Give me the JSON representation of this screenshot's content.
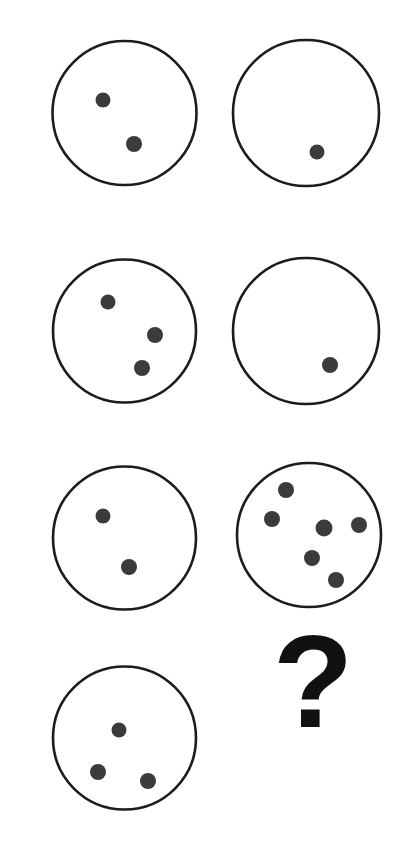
{
  "page": {
    "background_color": "#ffffff",
    "width": 418,
    "height": 841
  },
  "style": {
    "circle_stroke_color": "#1c1c1c",
    "circle_fill_color": "#ffffff",
    "circle_stroke_width": 2.6,
    "dot_color": "#3b3b3b",
    "question_mark_color": "#111111"
  },
  "puzzle": {
    "type": "visual-matrix-reasoning",
    "columns": 2,
    "rows": 4,
    "missing_cell_label": "?",
    "missing_cell_row": 4,
    "missing_cell_column": 2
  },
  "cells": [
    {
      "id": "cell-r1c1",
      "row": 1,
      "column": 1,
      "kind": "circle",
      "dot_count": 2,
      "circle": {
        "cx": 124.5,
        "cy": 113,
        "r": 72
      },
      "dots": [
        {
          "cx": 103,
          "cy": 100,
          "r": 7.5
        },
        {
          "cx": 134,
          "cy": 144,
          "r": 8
        }
      ]
    },
    {
      "id": "cell-r1c2",
      "row": 1,
      "column": 2,
      "kind": "circle",
      "dot_count": 1,
      "circle": {
        "cx": 306,
        "cy": 113,
        "r": 73
      },
      "dots": [
        {
          "cx": 317,
          "cy": 152,
          "r": 7.5
        }
      ]
    },
    {
      "id": "cell-r2c1",
      "row": 2,
      "column": 1,
      "kind": "circle",
      "dot_count": 3,
      "circle": {
        "cx": 124.5,
        "cy": 331,
        "r": 71.5
      },
      "dots": [
        {
          "cx": 108,
          "cy": 302,
          "r": 7.5
        },
        {
          "cx": 155,
          "cy": 335,
          "r": 8
        },
        {
          "cx": 142,
          "cy": 368,
          "r": 8
        }
      ]
    },
    {
      "id": "cell-r2c2",
      "row": 2,
      "column": 2,
      "kind": "circle",
      "dot_count": 1,
      "circle": {
        "cx": 306,
        "cy": 331,
        "r": 73
      },
      "dots": [
        {
          "cx": 330,
          "cy": 365,
          "r": 8
        }
      ]
    },
    {
      "id": "cell-r3c1",
      "row": 3,
      "column": 1,
      "kind": "circle",
      "dot_count": 2,
      "circle": {
        "cx": 124.5,
        "cy": 538,
        "r": 71.5
      },
      "dots": [
        {
          "cx": 103,
          "cy": 516,
          "r": 7.5
        },
        {
          "cx": 129,
          "cy": 567,
          "r": 8
        }
      ]
    },
    {
      "id": "cell-r3c2",
      "row": 3,
      "column": 2,
      "kind": "circle",
      "dot_count": 6,
      "circle": {
        "cx": 309,
        "cy": 535,
        "r": 72
      },
      "dots": [
        {
          "cx": 286,
          "cy": 490,
          "r": 8
        },
        {
          "cx": 272,
          "cy": 519,
          "r": 8
        },
        {
          "cx": 324,
          "cy": 528,
          "r": 8.5
        },
        {
          "cx": 359,
          "cy": 525,
          "r": 8
        },
        {
          "cx": 312,
          "cy": 558,
          "r": 8
        },
        {
          "cx": 336,
          "cy": 580,
          "r": 8
        }
      ]
    },
    {
      "id": "cell-r4c1",
      "row": 4,
      "column": 1,
      "kind": "circle",
      "dot_count": 3,
      "circle": {
        "cx": 124.5,
        "cy": 738,
        "r": 71.5
      },
      "dots": [
        {
          "cx": 119,
          "cy": 730,
          "r": 7.5
        },
        {
          "cx": 98,
          "cy": 772,
          "r": 8
        },
        {
          "cx": 148,
          "cy": 781,
          "r": 8
        }
      ]
    },
    {
      "id": "cell-r4c2",
      "row": 4,
      "column": 2,
      "kind": "question-mark",
      "dot_count": null,
      "label": "?",
      "position": {
        "x": 313,
        "y": 727
      },
      "font_size": 132
    }
  ]
}
